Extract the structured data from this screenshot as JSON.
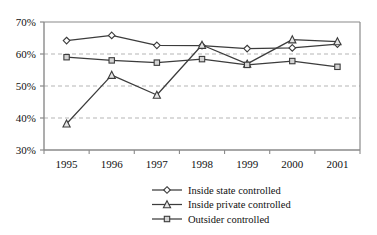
{
  "chart_data": {
    "type": "line",
    "title": "",
    "subtitle": "",
    "xlabel": "",
    "ylabel": "",
    "categories": [
      "1995",
      "1996",
      "1997",
      "1998",
      "1999",
      "2000",
      "2001"
    ],
    "x": [
      1995,
      1996,
      1997,
      1998,
      1999,
      2000,
      2001
    ],
    "ylim": [
      30,
      70
    ],
    "y_tick_labels": [
      "30%",
      "40%",
      "50%",
      "60%",
      "70%"
    ],
    "y_tick_values": [
      30,
      40,
      50,
      60,
      70
    ],
    "grid": "horizontal-dashed",
    "legend_position": "bottom-center",
    "series": [
      {
        "name": "Inside state controlled",
        "marker": "diamond",
        "marker_fill": "#ffffff",
        "values": [
          64.2,
          65.8,
          62.7,
          62.6,
          61.7,
          61.9,
          63.1
        ]
      },
      {
        "name": "Inside private controlled",
        "marker": "triangle",
        "marker_fill": "#e6e6e6",
        "values": [
          38.2,
          53.4,
          47.2,
          62.8,
          56.9,
          64.5,
          63.9
        ]
      },
      {
        "name": "Outsider controlled",
        "marker": "square",
        "marker_fill": "#d4d4d4",
        "values": [
          59.0,
          58.0,
          57.3,
          58.4,
          56.6,
          57.8,
          56.0
        ]
      }
    ]
  },
  "legend": {
    "items": [
      {
        "label": "Inside state controlled",
        "marker": "diamond"
      },
      {
        "label": "Inside private controlled",
        "marker": "triangle"
      },
      {
        "label": "Outsider controlled",
        "marker": "square"
      }
    ]
  },
  "axes": {
    "y_labels": [
      "70%",
      "60%",
      "50%",
      "40%",
      "30%"
    ],
    "x_labels": [
      "1995",
      "1996",
      "1997",
      "1998",
      "1999",
      "2000",
      "2001"
    ]
  },
  "colors": {
    "line": "#3c3c3c",
    "axis": "#808080",
    "grid": "#b5b5b5",
    "text": "#111111",
    "marker_state_fill": "#ffffff",
    "marker_private_fill": "#e6e6e6",
    "marker_outsider_fill": "#d4d4d4"
  }
}
